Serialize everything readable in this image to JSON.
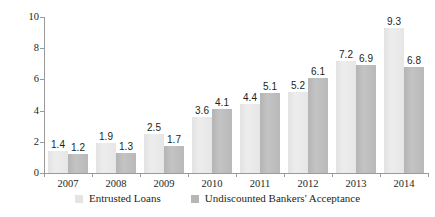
{
  "chart_data": {
    "type": "bar",
    "title": "",
    "subtitle": "",
    "xlabel": "",
    "ylabel": "",
    "categories": [
      "2007",
      "2008",
      "2009",
      "2010",
      "2011",
      "2012",
      "2013",
      "2014"
    ],
    "series": [
      {
        "name": "Entrusted Loans",
        "color": "#e4e4e4",
        "values": [
          1.4,
          1.9,
          2.5,
          3.6,
          4.4,
          5.2,
          7.2,
          9.3
        ],
        "labels": [
          "1.4",
          "1.9",
          "2.5",
          "3.6",
          "4.4",
          "5.2",
          "7.2",
          "9.3"
        ]
      },
      {
        "name": "Undiscounted Bankers' Acceptance",
        "color": "#b6b6b6",
        "values": [
          1.2,
          1.3,
          1.7,
          4.1,
          5.1,
          6.1,
          6.9,
          6.8
        ],
        "labels": [
          "1.2",
          "1.3",
          "1.7",
          "4.1",
          "5.1",
          "6.1",
          "6.9",
          "6.8"
        ]
      }
    ],
    "ylim": [
      0,
      10
    ],
    "yticks": [
      0,
      2,
      4,
      6,
      8,
      10
    ],
    "ytick_labels": [
      "0",
      "2",
      "4",
      "6",
      "8",
      "10"
    ],
    "grid": false,
    "legend_position": "bottom"
  },
  "legend": {
    "items": [
      {
        "label": "Entrusted Loans"
      },
      {
        "label": "Undiscounted Bankers' Acceptance"
      }
    ]
  }
}
